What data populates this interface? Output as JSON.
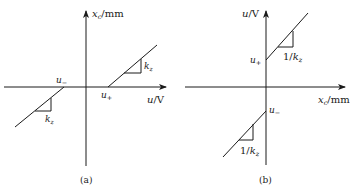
{
  "figure": {
    "panels": [
      {
        "id": "a",
        "caption": "(a)",
        "y_axis_label": {
          "var": "x",
          "sub": "c",
          "unit": "/mm"
        },
        "x_axis_label": {
          "var": "u",
          "unit": "/V"
        },
        "points": {
          "u_plus": "u",
          "u_plus_sub": "+",
          "u_minus": "u",
          "u_minus_sub": "−"
        },
        "slope_upper": {
          "var": "k",
          "sub": "z"
        },
        "slope_lower": {
          "var": "k",
          "sub": "z"
        }
      },
      {
        "id": "b",
        "caption": "(b)",
        "y_axis_label": {
          "var": "u",
          "unit": "/V"
        },
        "x_axis_label": {
          "var": "x",
          "sub": "c",
          "unit": "/mm"
        },
        "points": {
          "u_plus": "u",
          "u_plus_sub": "+",
          "u_minus": "u",
          "u_minus_sub": "−"
        },
        "slope_upper": {
          "prefix": "1/",
          "var": "k",
          "sub": "z"
        },
        "slope_lower": {
          "prefix": "1/",
          "var": "k",
          "sub": "z"
        }
      }
    ],
    "colors": {
      "line": "#1a1a1a",
      "background": "#ffffff"
    }
  }
}
